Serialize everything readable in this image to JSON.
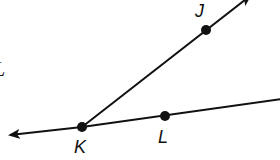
{
  "diagram": {
    "type": "geometry-angle",
    "stroke_color": "#111111",
    "background": "#ffffff",
    "points": [
      {
        "id": "K",
        "label": "K",
        "x": 82,
        "y": 127
      },
      {
        "id": "J",
        "label": "J",
        "x": 206,
        "y": 30
      },
      {
        "id": "L",
        "label": "L",
        "x": 165,
        "y": 116
      }
    ],
    "lines": [
      {
        "id": "line-KL",
        "from": "K",
        "through": "L",
        "kind": "line",
        "arrow_left": true,
        "extends_right": true
      },
      {
        "id": "ray-KJ",
        "from": "K",
        "through": "J",
        "kind": "ray",
        "arrow_end": true
      }
    ],
    "labels": {
      "J": "J",
      "K": "K",
      "L": "L",
      "edge_partial": "L"
    }
  }
}
